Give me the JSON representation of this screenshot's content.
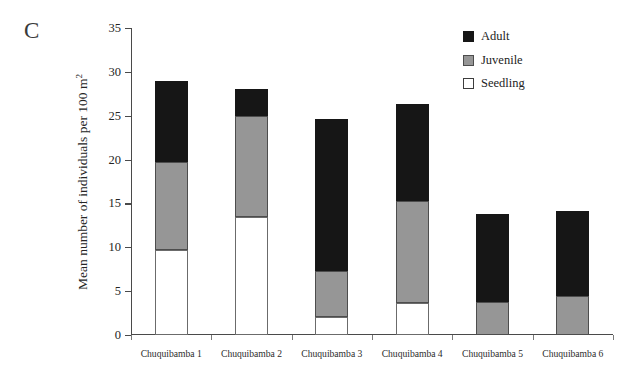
{
  "panel": {
    "letter": "C"
  },
  "axes": {
    "ylabel_main": "Mean number of individuals per 100 m",
    "ylabel_sup": "2",
    "yticks": [
      0,
      5,
      10,
      15,
      20,
      25,
      30,
      35
    ],
    "ymin": 0,
    "ymax": 35
  },
  "legend": {
    "items": [
      {
        "label": "Adult",
        "color": "#161616",
        "swatch": "filled-black-square-icon"
      },
      {
        "label": "Juvenile",
        "color": "#969696",
        "swatch": "filled-gray-square-icon"
      },
      {
        "label": "Seedling",
        "color": "#ffffff",
        "swatch": "open-white-square-icon"
      }
    ]
  },
  "chart_data": {
    "type": "bar",
    "subtype": "stacked",
    "title": "",
    "subtitle": "",
    "xlabel": "",
    "ylabel": "Mean number of individuals per 100 m2",
    "ylim": [
      0,
      35
    ],
    "yticks": [
      0,
      5,
      10,
      15,
      20,
      25,
      30,
      35
    ],
    "grid": false,
    "legend_position": "top-right",
    "categories": [
      "Chuquibamba 1",
      "Chuquibamba 2",
      "Chuquibamba 3",
      "Chuquibamba 4",
      "Chuquibamba 5",
      "Chuquibamba 6"
    ],
    "series": [
      {
        "name": "Seedling",
        "color": "#ffffff",
        "values": [
          9.7,
          13.4,
          2.1,
          3.7,
          0,
          0
        ]
      },
      {
        "name": "Juvenile",
        "color": "#969696",
        "values": [
          10.0,
          11.6,
          5.2,
          11.6,
          3.8,
          4.4
        ]
      },
      {
        "name": "Adult",
        "color": "#161616",
        "values": [
          9.3,
          3.0,
          17.3,
          11.0,
          10.0,
          9.7
        ]
      }
    ],
    "totals": [
      29.0,
      28.0,
      24.6,
      26.3,
      13.8,
      14.1
    ]
  }
}
